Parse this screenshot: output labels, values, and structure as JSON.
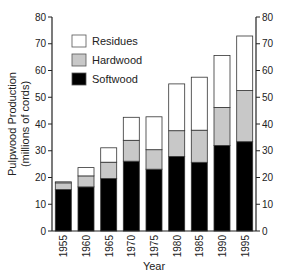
{
  "chart_data": {
    "type": "bar",
    "stacked": true,
    "title": "",
    "xlabel": "Year",
    "ylabel": "Pulpwood Production",
    "ylabel_sub": "(millions of cords)",
    "ylim": [
      0,
      80
    ],
    "yticks": [
      0,
      10,
      20,
      30,
      40,
      50,
      60,
      70,
      80
    ],
    "right_axis_ticks": [
      0,
      10,
      20,
      30,
      40,
      50,
      60,
      70,
      80
    ],
    "grid": false,
    "legend_position": "upper-left-inside",
    "categories": [
      "1955",
      "1960",
      "1965",
      "1970",
      "1975",
      "1980",
      "1985",
      "1990",
      "1995"
    ],
    "series": [
      {
        "name": "Softwood",
        "color": "#000000",
        "values": [
          15.5,
          16.5,
          19.6,
          26.1,
          23.1,
          27.9,
          25.7,
          32.0,
          33.4
        ]
      },
      {
        "name": "Hardwood",
        "color": "#c8c8c8",
        "values": [
          2.5,
          4.1,
          6.1,
          7.8,
          7.3,
          9.6,
          12.0,
          14.2,
          19.1
        ]
      },
      {
        "name": "Residues",
        "color": "#ffffff",
        "values": [
          0.4,
          3.1,
          5.4,
          8.6,
          12.3,
          17.5,
          19.8,
          19.4,
          20.4
        ]
      }
    ],
    "totals": [
      18.4,
      23.7,
      31.1,
      42.5,
      42.7,
      55.0,
      57.5,
      65.6,
      72.9
    ]
  },
  "legend": [
    {
      "label": "Residues",
      "color": "#ffffff"
    },
    {
      "label": "Hardwood",
      "color": "#c8c8c8"
    },
    {
      "label": "Softwood",
      "color": "#000000"
    }
  ]
}
